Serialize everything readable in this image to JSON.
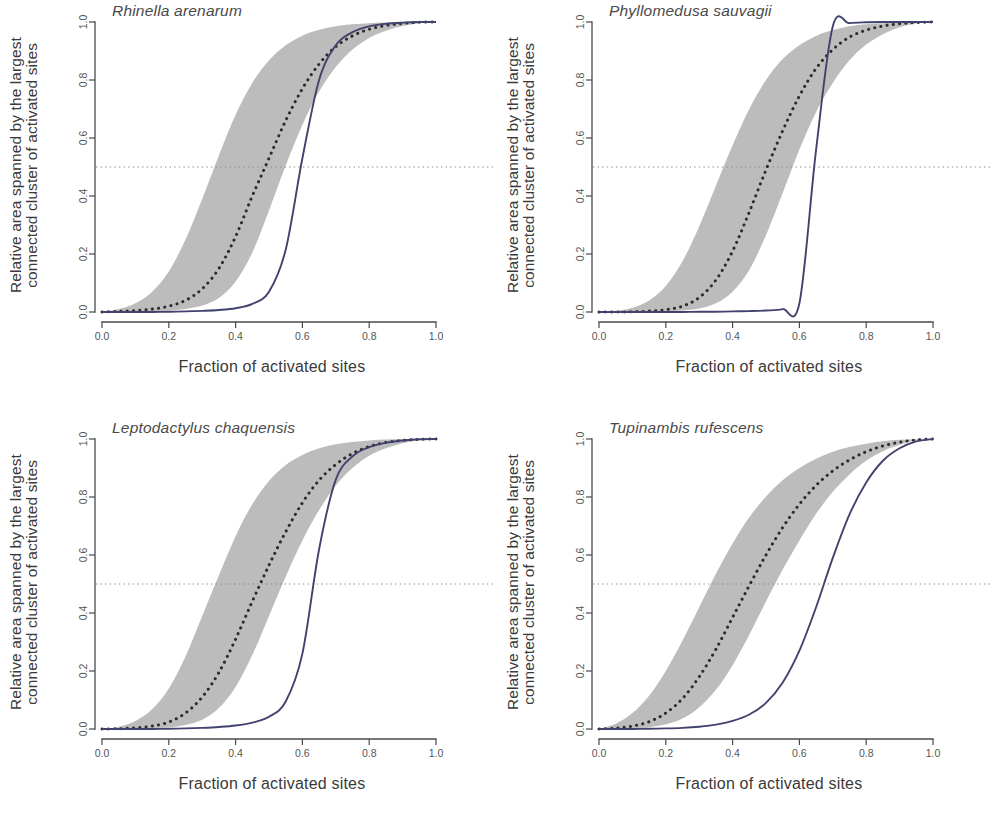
{
  "figure": {
    "type": "multi-panel-scatter-line",
    "panel_count": 4,
    "shared_xlabel": "Fraction of activated sites",
    "shared_ylabel_line1": "Relative area spanned by the largest",
    "shared_ylabel_line2": "connected cluster of activated sites",
    "colors": {
      "solid_curve": "#42426e",
      "dotted_curve": "#2b2b2b",
      "confidence_band": "#b6b6b6",
      "reference_line": "#8a8a8a",
      "axis": "#4a4a4a"
    }
  },
  "chart_data": [
    {
      "type": "line",
      "title": "Rhinella arenarum",
      "xlabel": "Fraction of activated sites",
      "ylabel": "Relative area spanned by the largest connected cluster of activated sites",
      "xlim": [
        0,
        1
      ],
      "ylim": [
        0,
        1
      ],
      "xticks": [
        "0.0",
        "0.2",
        "0.4",
        "0.6",
        "0.8",
        "1.0"
      ],
      "yticks": [
        "0.0",
        "0.2",
        "0.4",
        "0.6",
        "0.8",
        "1.0"
      ],
      "grid": false,
      "legend": "none",
      "annotations": [
        {
          "kind": "horizontal-reference-line",
          "y": 0.5,
          "style": "dotted"
        }
      ],
      "x": [
        0.0,
        0.05,
        0.1,
        0.15,
        0.2,
        0.25,
        0.3,
        0.35,
        0.4,
        0.45,
        0.5,
        0.55,
        0.6,
        0.65,
        0.7,
        0.75,
        0.8,
        0.85,
        0.9,
        0.95,
        1.0
      ],
      "series": [
        {
          "name": "Observed (solid)",
          "style": "solid",
          "values": [
            0.0,
            0.0,
            0.0,
            0.0,
            0.001,
            0.002,
            0.004,
            0.007,
            0.013,
            0.028,
            0.07,
            0.215,
            0.53,
            0.8,
            0.92,
            0.965,
            0.985,
            0.994,
            0.998,
            1.0,
            1.0
          ]
        },
        {
          "name": "Random expectation (dotted mean)",
          "style": "dotted",
          "values": [
            0.0,
            0.002,
            0.005,
            0.01,
            0.02,
            0.04,
            0.08,
            0.15,
            0.26,
            0.4,
            0.53,
            0.66,
            0.77,
            0.855,
            0.915,
            0.952,
            0.975,
            0.988,
            0.995,
            0.999,
            1.0
          ]
        },
        {
          "name": "Null envelope upper",
          "style": "band-upper",
          "values": [
            0.0,
            0.01,
            0.03,
            0.07,
            0.14,
            0.25,
            0.39,
            0.54,
            0.68,
            0.79,
            0.868,
            0.92,
            0.953,
            0.973,
            0.985,
            0.992,
            0.996,
            0.998,
            0.999,
            1.0,
            1.0
          ]
        },
        {
          "name": "Null envelope lower",
          "style": "band-lower",
          "values": [
            0.0,
            0.0,
            0.001,
            0.002,
            0.005,
            0.01,
            0.022,
            0.048,
            0.105,
            0.205,
            0.35,
            0.505,
            0.645,
            0.76,
            0.845,
            0.905,
            0.945,
            0.97,
            0.986,
            0.996,
            1.0
          ]
        }
      ]
    },
    {
      "type": "line",
      "title": "Phyllomedusa sauvagii",
      "xlabel": "Fraction of activated sites",
      "ylabel": "Relative area spanned by the largest connected cluster of activated sites",
      "xlim": [
        0,
        1
      ],
      "ylim": [
        0,
        1
      ],
      "xticks": [
        "0.0",
        "0.2",
        "0.4",
        "0.6",
        "0.8",
        "1.0"
      ],
      "yticks": [
        "0.0",
        "0.2",
        "0.4",
        "0.6",
        "0.8",
        "1.0"
      ],
      "grid": false,
      "legend": "none",
      "annotations": [
        {
          "kind": "horizontal-reference-line",
          "y": 0.5,
          "style": "dotted"
        }
      ],
      "x": [
        0.0,
        0.05,
        0.1,
        0.15,
        0.2,
        0.25,
        0.3,
        0.35,
        0.4,
        0.45,
        0.5,
        0.55,
        0.6,
        0.65,
        0.7,
        0.75,
        0.8,
        0.85,
        0.9,
        0.95,
        1.0
      ],
      "series": [
        {
          "name": "Observed (solid)",
          "style": "solid",
          "values": [
            0.0,
            0.0,
            0.0,
            0.0,
            0.0,
            0.0,
            0.001,
            0.001,
            0.002,
            0.003,
            0.005,
            0.01,
            0.03,
            0.56,
            0.985,
            0.996,
            0.999,
            1.0,
            1.0,
            1.0,
            1.0
          ]
        },
        {
          "name": "Random expectation (dotted mean)",
          "style": "dotted",
          "values": [
            0.0,
            0.0,
            0.001,
            0.003,
            0.008,
            0.02,
            0.05,
            0.11,
            0.21,
            0.345,
            0.49,
            0.625,
            0.745,
            0.84,
            0.905,
            0.948,
            0.972,
            0.986,
            0.994,
            0.998,
            1.0
          ]
        },
        {
          "name": "Null envelope upper",
          "style": "band-upper",
          "values": [
            0.0,
            0.004,
            0.015,
            0.04,
            0.09,
            0.175,
            0.295,
            0.435,
            0.575,
            0.7,
            0.8,
            0.872,
            0.92,
            0.952,
            0.972,
            0.985,
            0.992,
            0.996,
            0.999,
            1.0,
            1.0
          ]
        },
        {
          "name": "Null envelope lower",
          "style": "band-lower",
          "values": [
            0.0,
            0.0,
            0.0,
            0.001,
            0.002,
            0.005,
            0.012,
            0.03,
            0.07,
            0.145,
            0.265,
            0.41,
            0.56,
            0.69,
            0.79,
            0.868,
            0.922,
            0.958,
            0.982,
            0.995,
            1.0
          ]
        }
      ]
    },
    {
      "type": "line",
      "title": "Leptodactylus chaquensis",
      "xlabel": "Fraction of activated sites",
      "ylabel": "Relative area spanned by the largest connected cluster of activated sites",
      "xlim": [
        0,
        1
      ],
      "ylim": [
        0,
        1
      ],
      "xticks": [
        "0.0",
        "0.2",
        "0.4",
        "0.6",
        "0.8",
        "1.0"
      ],
      "yticks": [
        "0.0",
        "0.2",
        "0.4",
        "0.6",
        "0.8",
        "1.0"
      ],
      "grid": false,
      "legend": "none",
      "annotations": [
        {
          "kind": "horizontal-reference-line",
          "y": 0.5,
          "style": "dotted"
        }
      ],
      "x": [
        0.0,
        0.05,
        0.1,
        0.15,
        0.2,
        0.25,
        0.3,
        0.35,
        0.4,
        0.45,
        0.5,
        0.55,
        0.6,
        0.65,
        0.7,
        0.75,
        0.8,
        0.85,
        0.9,
        0.95,
        1.0
      ],
      "series": [
        {
          "name": "Observed (solid)",
          "style": "solid",
          "values": [
            0.0,
            0.0,
            0.0,
            0.0,
            0.001,
            0.002,
            0.004,
            0.007,
            0.012,
            0.022,
            0.042,
            0.095,
            0.26,
            0.62,
            0.86,
            0.94,
            0.972,
            0.987,
            0.995,
            0.999,
            1.0
          ]
        },
        {
          "name": "Random expectation (dotted mean)",
          "style": "dotted",
          "values": [
            0.0,
            0.001,
            0.004,
            0.01,
            0.024,
            0.055,
            0.11,
            0.195,
            0.31,
            0.44,
            0.565,
            0.68,
            0.78,
            0.858,
            0.912,
            0.95,
            0.974,
            0.988,
            0.995,
            0.999,
            1.0
          ]
        },
        {
          "name": "Null envelope upper",
          "style": "band-upper",
          "values": [
            0.0,
            0.008,
            0.028,
            0.068,
            0.14,
            0.25,
            0.39,
            0.53,
            0.665,
            0.775,
            0.855,
            0.91,
            0.945,
            0.968,
            0.982,
            0.99,
            0.995,
            0.998,
            0.999,
            1.0,
            1.0
          ]
        },
        {
          "name": "Null envelope lower",
          "style": "band-lower",
          "values": [
            0.0,
            0.0,
            0.001,
            0.002,
            0.006,
            0.014,
            0.032,
            0.072,
            0.145,
            0.255,
            0.39,
            0.525,
            0.65,
            0.755,
            0.84,
            0.9,
            0.942,
            0.968,
            0.985,
            0.996,
            1.0
          ]
        }
      ]
    },
    {
      "type": "line",
      "title": "Tupinambis rufescens",
      "xlabel": "Fraction of activated sites",
      "ylabel": "Relative area spanned by the largest connected cluster of activated sites",
      "xlim": [
        0,
        1
      ],
      "ylim": [
        0,
        1
      ],
      "xticks": [
        "0.0",
        "0.2",
        "0.4",
        "0.6",
        "0.8",
        "1.0"
      ],
      "yticks": [
        "0.0",
        "0.2",
        "0.4",
        "0.6",
        "0.8",
        "1.0"
      ],
      "grid": false,
      "legend": "none",
      "annotations": [
        {
          "kind": "horizontal-reference-line",
          "y": 0.5,
          "style": "dotted"
        }
      ],
      "x": [
        0.0,
        0.05,
        0.1,
        0.15,
        0.2,
        0.25,
        0.3,
        0.35,
        0.4,
        0.45,
        0.5,
        0.55,
        0.6,
        0.65,
        0.7,
        0.75,
        0.8,
        0.85,
        0.9,
        0.95,
        1.0
      ],
      "series": [
        {
          "name": "Observed (solid)",
          "style": "solid",
          "values": [
            0.0,
            0.0,
            0.0,
            0.001,
            0.002,
            0.004,
            0.008,
            0.015,
            0.028,
            0.05,
            0.09,
            0.16,
            0.27,
            0.42,
            0.59,
            0.74,
            0.85,
            0.925,
            0.968,
            0.992,
            1.0
          ]
        },
        {
          "name": "Random expectation (dotted mean)",
          "style": "dotted",
          "values": [
            0.0,
            0.003,
            0.01,
            0.025,
            0.055,
            0.105,
            0.18,
            0.275,
            0.385,
            0.495,
            0.6,
            0.695,
            0.775,
            0.84,
            0.89,
            0.928,
            0.956,
            0.976,
            0.989,
            0.997,
            1.0
          ]
        },
        {
          "name": "Null envelope upper",
          "style": "band-upper",
          "values": [
            0.0,
            0.018,
            0.055,
            0.115,
            0.2,
            0.305,
            0.42,
            0.535,
            0.64,
            0.73,
            0.802,
            0.858,
            0.9,
            0.932,
            0.956,
            0.972,
            0.984,
            0.992,
            0.997,
            0.999,
            1.0
          ]
        },
        {
          "name": "Null envelope lower",
          "style": "band-lower",
          "values": [
            0.0,
            0.0,
            0.002,
            0.006,
            0.016,
            0.036,
            0.075,
            0.135,
            0.22,
            0.325,
            0.44,
            0.55,
            0.65,
            0.742,
            0.818,
            0.878,
            0.925,
            0.958,
            0.98,
            0.995,
            1.0
          ]
        }
      ]
    }
  ],
  "panels": [
    {
      "id": "panel-rhinella-arenarum",
      "title": "Rhinella arenarum",
      "xlabel": "Fraction of activated sites",
      "ylabel_line1": "Relative area spanned by the largest",
      "ylabel_line2": "connected cluster of activated sites",
      "xticks": [
        "0.0",
        "0.2",
        "0.4",
        "0.6",
        "0.8",
        "1.0"
      ],
      "yticks": [
        "1.0",
        "0.8",
        "0.6",
        "0.4",
        "0.2",
        "0.0"
      ]
    },
    {
      "id": "panel-phyllomedusa-sauvagii",
      "title": "Phyllomedusa sauvagii",
      "xlabel": "Fraction of activated sites",
      "ylabel_line1": "Relative area spanned by the largest",
      "ylabel_line2": "connected cluster of activated sites",
      "xticks": [
        "0.0",
        "0.2",
        "0.4",
        "0.6",
        "0.8",
        "1.0"
      ],
      "yticks": [
        "1.0",
        "0.8",
        "0.6",
        "0.4",
        "0.2",
        "0.0"
      ]
    },
    {
      "id": "panel-leptodactylus-chaquensis",
      "title": "Leptodactylus chaquensis",
      "xlabel": "Fraction of activated sites",
      "ylabel_line1": "Relative area spanned by the largest",
      "ylabel_line2": "connected cluster of activated sites",
      "xticks": [
        "0.0",
        "0.2",
        "0.4",
        "0.6",
        "0.8",
        "1.0"
      ],
      "yticks": [
        "1.0",
        "0.8",
        "0.6",
        "0.4",
        "0.2",
        "0.0"
      ]
    },
    {
      "id": "panel-tupinambis-rufescens",
      "title": "Tupinambis rufescens",
      "xlabel": "Fraction of activated sites",
      "ylabel_line1": "Relative area spanned by the largest",
      "ylabel_line2": "connected cluster of activated sites",
      "xticks": [
        "0.0",
        "0.2",
        "0.4",
        "0.6",
        "0.8",
        "1.0"
      ],
      "yticks": [
        "1.0",
        "0.8",
        "0.6",
        "0.4",
        "0.2",
        "0.0"
      ]
    }
  ]
}
